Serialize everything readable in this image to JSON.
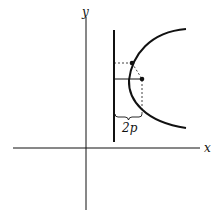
{
  "diagram": {
    "axes": {
      "x_label": "x",
      "y_label": "y"
    },
    "annotations": {
      "distance_label": "2p"
    },
    "elements": [
      "x-axis",
      "y-axis",
      "directrix",
      "parabola-opening-right",
      "point-on-parabola",
      "focus-point",
      "dashed-line-point-to-directrix",
      "dashed-line-point-to-focus",
      "solid-line-focus-to-directrix",
      "brace-2p"
    ],
    "colors": {
      "stroke": "#111111",
      "background": "#ffffff"
    }
  }
}
